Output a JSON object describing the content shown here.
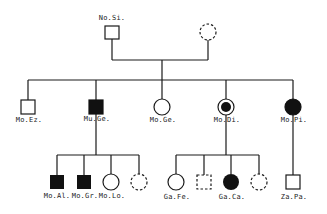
{
  "diagram": {
    "type": "pedigree",
    "colors": {
      "line": "#1a1a1a",
      "affected_fill": "#111111",
      "background": "#ffffff"
    },
    "generation1": {
      "father": {
        "label": "No.Si.",
        "shape": "square",
        "status": "unaffected"
      },
      "mother": {
        "label": "",
        "shape": "circle",
        "status": "dashed"
      }
    },
    "generation2": [
      {
        "label": "Mo.Ez.",
        "shape": "square",
        "status": "unaffected"
      },
      {
        "label": "Mu.Ge.",
        "shape": "square",
        "status": "affected"
      },
      {
        "label": "Mo.Ge.",
        "shape": "circle",
        "status": "unaffected"
      },
      {
        "label": "Mo.Di.",
        "shape": "circle",
        "status": "carrier-dot"
      },
      {
        "label": "Mo.Pi.",
        "shape": "circle",
        "status": "affected"
      }
    ],
    "generation3": {
      "family_mu_ge": [
        {
          "label": "Mo.Al.",
          "shape": "square",
          "status": "affected"
        },
        {
          "label": "Mo.Gr.",
          "shape": "square",
          "status": "affected"
        },
        {
          "label": "Mo.Lo.",
          "shape": "circle",
          "status": "unaffected"
        },
        {
          "label": "",
          "shape": "circle",
          "status": "dashed"
        }
      ],
      "family_mo_di": [
        {
          "label": "Ga.Fe.",
          "shape": "circle",
          "status": "unaffected"
        },
        {
          "label": "",
          "shape": "square",
          "status": "dashed"
        },
        {
          "label": "Ga.Ca.",
          "shape": "circle",
          "status": "affected"
        },
        {
          "label": "",
          "shape": "circle",
          "status": "dashed"
        }
      ],
      "family_mo_pi": [
        {
          "label": "Za.Pa.",
          "shape": "square",
          "status": "unaffected"
        }
      ]
    }
  }
}
